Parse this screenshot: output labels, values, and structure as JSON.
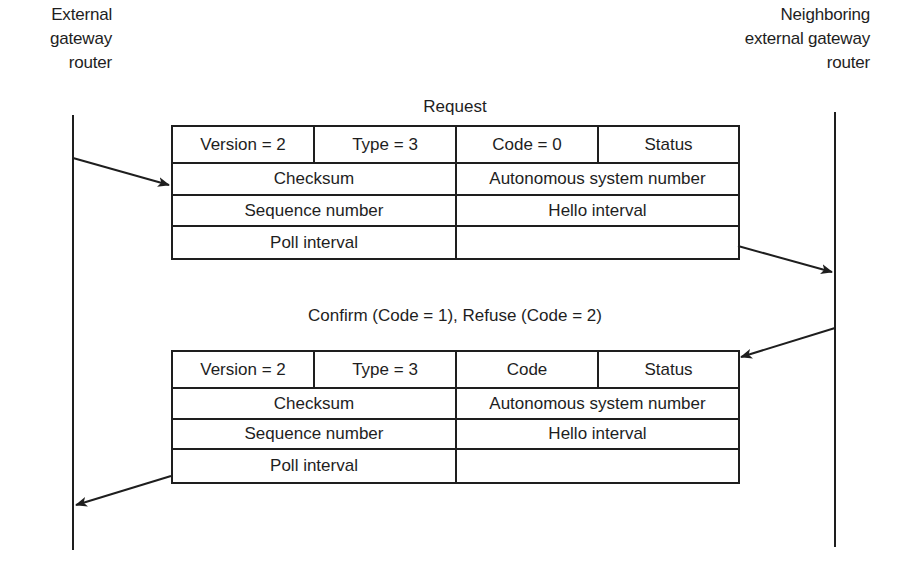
{
  "left_entity": {
    "lines": [
      "External",
      "gateway",
      "router"
    ]
  },
  "right_entity": {
    "lines": [
      "Neighboring",
      "external gateway",
      "router"
    ]
  },
  "request": {
    "caption": "Request",
    "rows": [
      [
        "Version = 2",
        "Type = 3",
        "Code = 0",
        "Status"
      ],
      [
        "Checksum",
        "Autonomous system number"
      ],
      [
        "Sequence number",
        "Hello interval"
      ],
      [
        "Poll interval",
        ""
      ]
    ]
  },
  "response": {
    "caption": "Confirm (Code = 1), Refuse (Code = 2)",
    "rows": [
      [
        "Version = 2",
        "Type = 3",
        "Code",
        "Status"
      ],
      [
        "Checksum",
        "Autonomous system number"
      ],
      [
        "Sequence number",
        "Hello interval"
      ],
      [
        "Poll interval",
        ""
      ]
    ]
  },
  "colors": {
    "ink": "#1e1e1e",
    "background": "#ffffff"
  }
}
